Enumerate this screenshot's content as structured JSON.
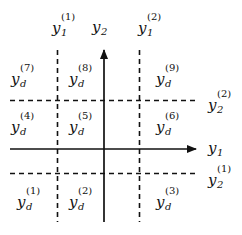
{
  "diagram": {
    "axes": {
      "horizontal": {
        "label": "y",
        "subscript": "1"
      },
      "vertical": {
        "label": "y",
        "subscript": "2"
      }
    },
    "thresholds": {
      "y1": [
        {
          "label": "y",
          "subscript": "1",
          "superscript": "(1)"
        },
        {
          "label": "y",
          "subscript": "1",
          "superscript": "(2)"
        }
      ],
      "y2": [
        {
          "label": "y",
          "subscript": "2",
          "superscript": "(1)"
        },
        {
          "label": "y",
          "subscript": "2",
          "superscript": "(2)"
        }
      ]
    },
    "regions": [
      {
        "label": "y",
        "subscript": "d",
        "superscript": "(1)"
      },
      {
        "label": "y",
        "subscript": "d",
        "superscript": "(2)"
      },
      {
        "label": "y",
        "subscript": "d",
        "superscript": "(3)"
      },
      {
        "label": "y",
        "subscript": "d",
        "superscript": "(4)"
      },
      {
        "label": "y",
        "subscript": "d",
        "superscript": "(5)"
      },
      {
        "label": "y",
        "subscript": "d",
        "superscript": "(6)"
      },
      {
        "label": "y",
        "subscript": "d",
        "superscript": "(7)"
      },
      {
        "label": "y",
        "subscript": "d",
        "superscript": "(8)"
      },
      {
        "label": "y",
        "subscript": "d",
        "superscript": "(9)"
      }
    ],
    "colors": {
      "line": "#111111",
      "background": "#ffffff"
    }
  }
}
